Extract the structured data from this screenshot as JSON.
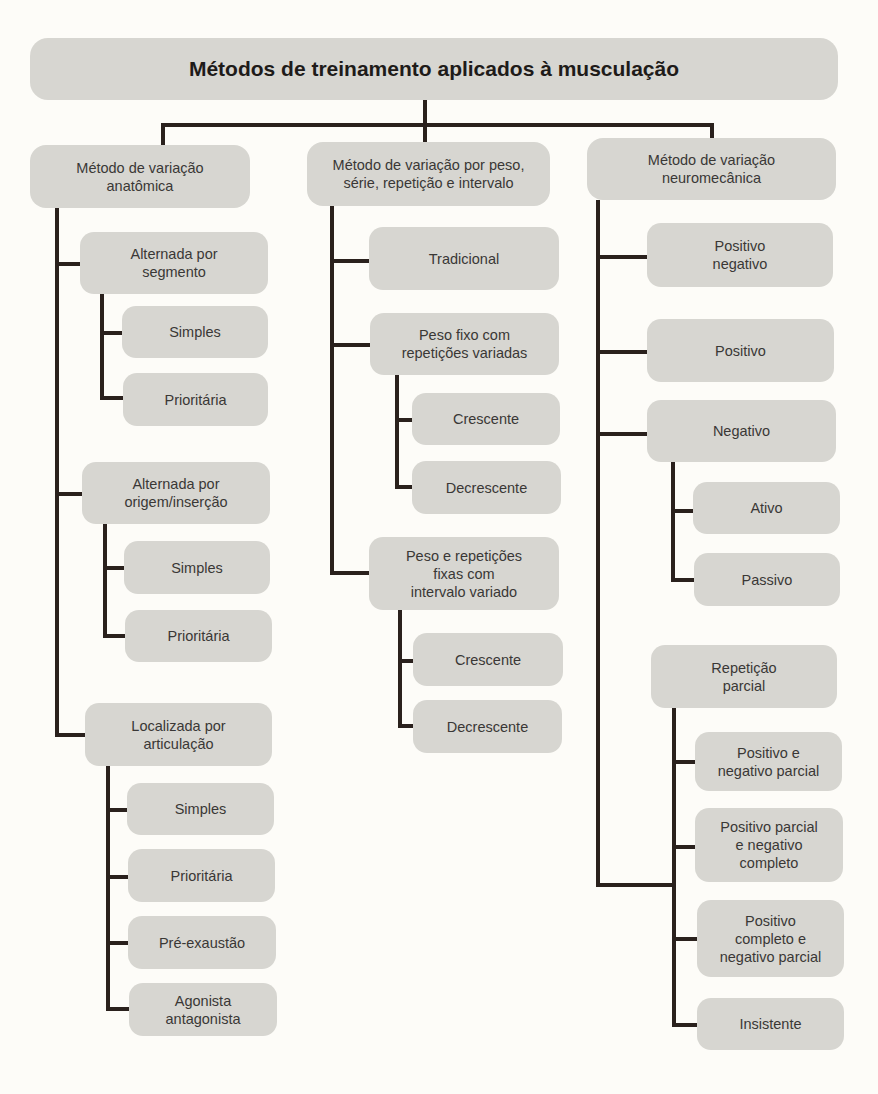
{
  "diagram": {
    "title": "Métodos de treinamento aplicados à musculação",
    "colors": {
      "background": "#fdfcf8",
      "box_fill": "#d7d6d1",
      "connector": "#2a211d",
      "text": "#3a3836"
    },
    "branches": [
      {
        "label": "Método de variação\nanatômica",
        "children": [
          {
            "label": "Alternada por\nsegmento",
            "children": [
              {
                "label": "Simples"
              },
              {
                "label": "Prioritária"
              }
            ]
          },
          {
            "label": "Alternada por\norigem/inserção",
            "children": [
              {
                "label": "Simples"
              },
              {
                "label": "Prioritária"
              }
            ]
          },
          {
            "label": "Localizada por\narticulação",
            "children": [
              {
                "label": "Simples"
              },
              {
                "label": "Prioritária"
              },
              {
                "label": "Pré-exaustão"
              },
              {
                "label": "Agonista\nantagonista"
              }
            ]
          }
        ]
      },
      {
        "label": "Método de variação por peso,\nsérie, repetição e intervalo",
        "children": [
          {
            "label": "Tradicional"
          },
          {
            "label": "Peso fixo com\nrepetições variadas",
            "children": [
              {
                "label": "Crescente"
              },
              {
                "label": "Decrescente"
              }
            ]
          },
          {
            "label": "Peso e repetições\nfixas com\nintervalo variado",
            "children": [
              {
                "label": "Crescente"
              },
              {
                "label": "Decrescente"
              }
            ]
          }
        ]
      },
      {
        "label": "Método de variação\nneuromecânica",
        "children": [
          {
            "label": "Positivo\nnegativo"
          },
          {
            "label": "Positivo"
          },
          {
            "label": "Negativo",
            "children": [
              {
                "label": "Ativo"
              },
              {
                "label": "Passivo"
              }
            ]
          },
          {
            "label": "Repetição\nparcial",
            "children": [
              {
                "label": "Positivo e\nnegativo parcial"
              },
              {
                "label": "Positivo parcial\ne negativo\ncompleto"
              },
              {
                "label": "Positivo\ncompleto e\nnegativo parcial"
              },
              {
                "label": "Insistente"
              }
            ]
          }
        ]
      }
    ]
  }
}
